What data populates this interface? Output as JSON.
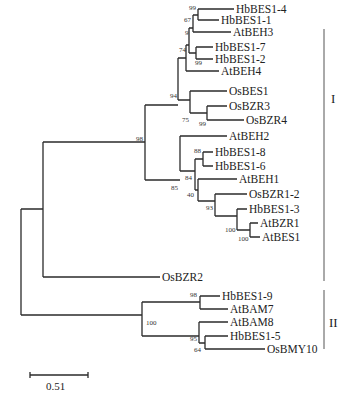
{
  "tree": {
    "leaves": [
      {
        "name": "HbBES1-4",
        "x": 236,
        "y": 9
      },
      {
        "name": "HbBES1-1",
        "x": 221,
        "y": 20
      },
      {
        "name": "AtBEH3",
        "x": 233,
        "y": 32
      },
      {
        "name": "HbBES1-7",
        "x": 215,
        "y": 47
      },
      {
        "name": "HbBES1-2",
        "x": 215,
        "y": 59
      },
      {
        "name": "AtBEH4",
        "x": 221,
        "y": 71
      },
      {
        "name": "OsBES1",
        "x": 229,
        "y": 91
      },
      {
        "name": "OsBZR3",
        "x": 229,
        "y": 106
      },
      {
        "name": "OsBZR4",
        "x": 246,
        "y": 120
      },
      {
        "name": "AtBEH2",
        "x": 229,
        "y": 136
      },
      {
        "name": "HbBES1-8",
        "x": 215,
        "y": 152
      },
      {
        "name": "HbBES1-6",
        "x": 215,
        "y": 166
      },
      {
        "name": "AtBEH1",
        "x": 239,
        "y": 179
      },
      {
        "name": "OsBZR1-2",
        "x": 249,
        "y": 194
      },
      {
        "name": "HbBES1-3",
        "x": 249,
        "y": 209
      },
      {
        "name": "AtBZR1",
        "x": 260,
        "y": 223
      },
      {
        "name": "AtBES1",
        "x": 262,
        "y": 237
      },
      {
        "name": "OsBZR2",
        "x": 162,
        "y": 277
      },
      {
        "name": "HbBES1-9",
        "x": 222,
        "y": 296
      },
      {
        "name": "AtBAM7",
        "x": 230,
        "y": 309
      },
      {
        "name": "AtBAM8",
        "x": 230,
        "y": 322
      },
      {
        "name": "HbBES1-5",
        "x": 230,
        "y": 336
      },
      {
        "name": "OsBMY10",
        "x": 267,
        "y": 349
      }
    ],
    "bootstrap": [
      {
        "value": "99",
        "x": 195,
        "y": 14
      },
      {
        "value": "67",
        "x": 188,
        "y": 25
      },
      {
        "value": "9",
        "x": 182,
        "y": 38
      },
      {
        "value": "74",
        "x": 181,
        "y": 52
      },
      {
        "value": "99",
        "x": 187,
        "y": 62
      },
      {
        "value": "94",
        "x": 175,
        "y": 75
      },
      {
        "value": "75",
        "x": 191,
        "y": 112
      },
      {
        "value": "99",
        "x": 208,
        "y": 125
      },
      {
        "value": "98",
        "x": 137,
        "y": 139
      },
      {
        "value": "88",
        "x": 197,
        "y": 150
      },
      {
        "value": "85",
        "x": 172,
        "y": 162
      },
      {
        "value": "84",
        "x": 185,
        "y": 178
      },
      {
        "value": "40",
        "x": 185,
        "y": 194
      },
      {
        "value": "93",
        "x": 205,
        "y": 208
      },
      {
        "value": "100",
        "x": 226,
        "y": 223
      },
      {
        "value": "100",
        "x": 239,
        "y": 236
      },
      {
        "value": "98",
        "x": 189,
        "y": 292
      },
      {
        "value": "100",
        "x": 157,
        "y": 323
      },
      {
        "value": "95",
        "x": 193,
        "y": 339
      },
      {
        "value": "64",
        "x": 193,
        "y": 350
      }
    ],
    "clades": [
      {
        "label": "I",
        "x": 334,
        "y": 99
      },
      {
        "label": "II",
        "x": 332,
        "y": 325
      }
    ],
    "scale_bar": {
      "label": "0.51",
      "value": 0.51
    }
  }
}
